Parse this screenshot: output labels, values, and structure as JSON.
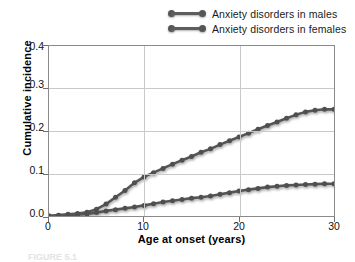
{
  "chart_data": {
    "type": "line",
    "title": "",
    "xlabel": "Age at onset (years)",
    "ylabel": "Cumulative incidence",
    "xlim": [
      0,
      30
    ],
    "ylim": [
      0.0,
      0.4
    ],
    "xticks": [
      "0",
      "10",
      "20",
      "30"
    ],
    "yticks": [
      "0.0",
      "0.1",
      "0.2",
      "0.3",
      "0.4"
    ],
    "grid": "both",
    "legend_position": "above-right",
    "line_color": "#555555",
    "marker": "circle",
    "x": [
      0,
      1,
      2,
      3,
      4,
      5,
      6,
      7,
      8,
      9,
      10,
      11,
      12,
      13,
      14,
      15,
      16,
      17,
      18,
      19,
      20,
      21,
      22,
      23,
      24,
      25,
      26,
      27,
      28,
      29,
      30
    ],
    "series": [
      {
        "name": "Anxiety disorders in males",
        "values": [
          0.0,
          0.001,
          0.002,
          0.003,
          0.005,
          0.008,
          0.012,
          0.015,
          0.018,
          0.021,
          0.025,
          0.029,
          0.033,
          0.036,
          0.039,
          0.042,
          0.044,
          0.047,
          0.051,
          0.055,
          0.059,
          0.062,
          0.065,
          0.068,
          0.07,
          0.072,
          0.073,
          0.074,
          0.075,
          0.076,
          0.076
        ]
      },
      {
        "name": "Anxiety disorders in females",
        "values": [
          0.0,
          0.002,
          0.004,
          0.006,
          0.009,
          0.016,
          0.028,
          0.044,
          0.06,
          0.078,
          0.092,
          0.102,
          0.112,
          0.122,
          0.131,
          0.14,
          0.15,
          0.158,
          0.168,
          0.177,
          0.186,
          0.195,
          0.204,
          0.213,
          0.221,
          0.23,
          0.238,
          0.245,
          0.249,
          0.251,
          0.251
        ]
      }
    ]
  },
  "legend": {
    "items": [
      {
        "label": "Anxiety disorders in males"
      },
      {
        "label": "Anxiety disorders in females"
      }
    ]
  },
  "caption": {
    "text": "FIGURE 5.1"
  }
}
